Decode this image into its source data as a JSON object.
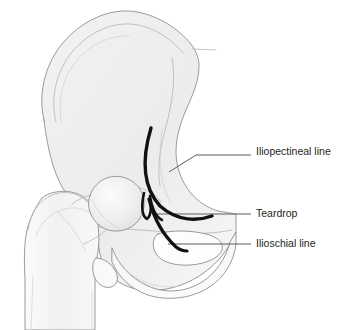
{
  "figure": {
    "view": "anteroposterior pelvis and proximal femur",
    "background_color": "#ffffff",
    "bone_fill_color": "#eeeeee",
    "bone_fill_light": "#f6f6f6",
    "bone_outline_color": "#8e8e8e",
    "landmark_line_color": "#111111",
    "leader_line_color": "#5d5d5d",
    "label_text_color": "#231f20"
  },
  "labels": [
    {
      "id": "iliopectineal",
      "text": "Iliopectineal line",
      "text_x": 256,
      "text_y": 152,
      "leader_path": "M 169 172 L 196 155 L 251 155",
      "landmark_path": "M 151 128 C 142 158 142 186 160 206 C 178 222 198 221 212 216"
    },
    {
      "id": "teardrop",
      "text": "Teardrop",
      "text_x": 256,
      "text_y": 214,
      "leader_path": "M 152 214 L 251 214",
      "landmark_path": "M 144 193 C 141 207 142 216 147 219 C 152 215 151 206 150 196 M 150 196 C 152 209 156 217 162 220"
    },
    {
      "id": "ilioschial",
      "text": "Ilioschial line",
      "text_x": 256,
      "text_y": 244,
      "leader_path": "M 168 244 L 251 244",
      "landmark_path": "M 149 199 C 153 215 162 234 176 247 C 180 250 184 251 187 251"
    }
  ],
  "anatomy_parts": [
    {
      "id": "ilium",
      "name": "ilium"
    },
    {
      "id": "iliac-crest",
      "name": "iliac crest"
    },
    {
      "id": "sacral-stub",
      "name": "sacroiliac joint stub"
    },
    {
      "id": "acetabulum",
      "name": "acetabulum"
    },
    {
      "id": "obturator-foramen",
      "name": "obturator foramen"
    },
    {
      "id": "ischium-pubis",
      "name": "ischium and pubis"
    },
    {
      "id": "femoral-head",
      "name": "femoral head"
    },
    {
      "id": "femoral-neck",
      "name": "femoral neck"
    },
    {
      "id": "greater-trochanter",
      "name": "greater trochanter"
    },
    {
      "id": "lesser-trochanter",
      "name": "lesser trochanter"
    },
    {
      "id": "femoral-shaft",
      "name": "femoral shaft"
    }
  ]
}
